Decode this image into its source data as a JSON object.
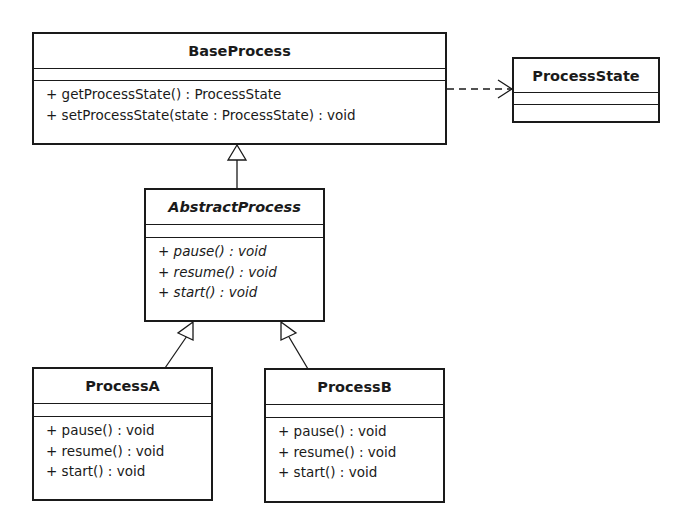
{
  "diagram": {
    "type": "UML class diagram",
    "classes": {
      "base_process": {
        "name": "BaseProcess",
        "abstract": false,
        "attributes": [],
        "operations": [
          "+ getProcessState() : ProcessState",
          "+ setProcessState(state : ProcessState) : void"
        ]
      },
      "process_state": {
        "name": "ProcessState",
        "abstract": false,
        "attributes": [],
        "operations": []
      },
      "abstract_process": {
        "name": "AbstractProcess",
        "abstract": true,
        "attributes": [],
        "operations": [
          "+ pause() : void",
          "+ resume() : void",
          "+ start() : void"
        ]
      },
      "process_a": {
        "name": "ProcessA",
        "abstract": false,
        "attributes": [],
        "operations": [
          "+ pause() : void",
          "+ resume() : void",
          "+ start() : void"
        ]
      },
      "process_b": {
        "name": "ProcessB",
        "abstract": false,
        "attributes": [],
        "operations": [
          "+ pause() : void",
          "+ resume() : void",
          "+ start() : void"
        ]
      }
    },
    "relationships": [
      {
        "type": "dependency",
        "from": "BaseProcess",
        "to": "ProcessState",
        "style": "dashed-open-arrow"
      },
      {
        "type": "generalization",
        "from": "AbstractProcess",
        "to": "BaseProcess",
        "style": "hollow-triangle"
      },
      {
        "type": "generalization",
        "from": "ProcessA",
        "to": "AbstractProcess",
        "style": "hollow-triangle"
      },
      {
        "type": "generalization",
        "from": "ProcessB",
        "to": "AbstractProcess",
        "style": "hollow-triangle"
      }
    ],
    "colors": {
      "line": "#1a1a1a",
      "background": "#ffffff"
    }
  }
}
